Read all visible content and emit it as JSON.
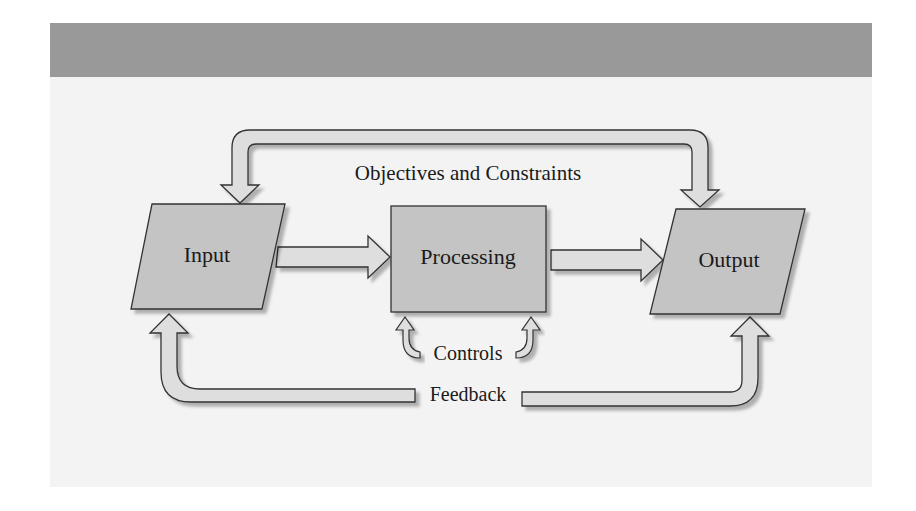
{
  "diagram": {
    "header_band": "",
    "nodes": [
      {
        "id": "input",
        "label": "Input",
        "shape": "parallelogram"
      },
      {
        "id": "processing",
        "label": "Processing",
        "shape": "rectangle"
      },
      {
        "id": "output",
        "label": "Output",
        "shape": "parallelogram"
      }
    ],
    "edges": [
      {
        "from": "input",
        "to": "processing",
        "label": ""
      },
      {
        "from": "processing",
        "to": "output",
        "label": ""
      },
      {
        "from": "objectives",
        "to": [
          "input",
          "output"
        ],
        "label": "Objectives and Constraints"
      },
      {
        "from": "controls",
        "to": "processing",
        "label": "Controls"
      },
      {
        "from": "feedback",
        "to": [
          "input",
          "output"
        ],
        "label": "Feedback"
      }
    ],
    "labels": {
      "input": "Input",
      "processing": "Processing",
      "output": "Output",
      "objectives": "Objectives and Constraints",
      "controls": "Controls",
      "feedback": "Feedback"
    },
    "colors": {
      "header": "#999999",
      "panel": "#f3f3f3",
      "node_fill": "#c4c4c4",
      "arrow_fill": "#dedede",
      "stroke": "#333333"
    }
  }
}
